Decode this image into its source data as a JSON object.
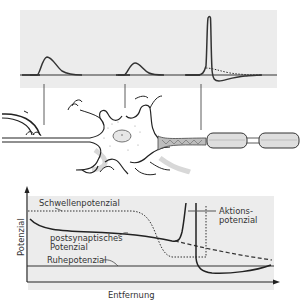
{
  "diagram": {
    "top_panel": {
      "traces": [
        {
          "name": "postsynaptic-potential-dendrite",
          "shape": "small hump"
        },
        {
          "name": "postsynaptic-potential-soma",
          "shape": "smaller hump"
        },
        {
          "name": "action-potential-axon-hillock",
          "shape": "tall spike with undershoot, dotted subthreshold tail"
        }
      ],
      "background": "#ececec"
    },
    "neuron": {
      "parts": [
        "synapse",
        "dendrites",
        "soma",
        "nucleus",
        "axon-hillock",
        "myelinated-axon"
      ]
    },
    "bottom_chart": {
      "ylabel": "Potenzial",
      "xlabel": "Entfernung",
      "labels": {
        "threshold": "Schwellenpotenzial",
        "psp_line1": "postsynaptisches",
        "psp_line2": "Potenzial",
        "resting": "Ruhepotenzial",
        "ap_line1": "Aktions-",
        "ap_line2": "potenzial"
      },
      "background": "#ececec"
    },
    "colors": {
      "line": "#333333",
      "panel": "#ececec",
      "shadow": "#d4d4d4"
    }
  }
}
